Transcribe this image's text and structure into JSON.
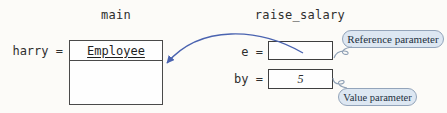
{
  "diagram": {
    "kind": "parameter-passing-memory-diagram",
    "main_frame": {
      "title": "main",
      "variable_label": "harry =",
      "object": {
        "class_name": "Employee",
        "fields": [
          ""
        ]
      }
    },
    "raise_salary_frame": {
      "title": "raise_salary",
      "param_e_label": "e =",
      "param_e_value": "",
      "param_by_label": "by =",
      "param_by_value": "5"
    },
    "callouts": {
      "reference": "Reference parameter",
      "value": "Value parameter"
    },
    "colors": {
      "background": "#fcfbf8",
      "box_border": "#4a4a4a",
      "arrow_blue": "#4a63b0",
      "callout_fill": "#dde7f2",
      "callout_border": "#93a4ba",
      "callout_text": "#233040",
      "text": "#2e2e2e"
    }
  }
}
